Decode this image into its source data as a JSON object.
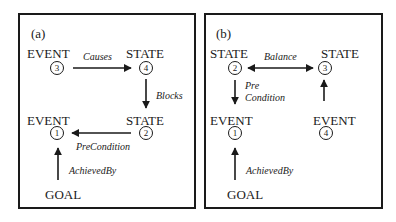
{
  "panels": [
    {
      "tag": "(a)",
      "nodes": [
        {
          "type": "EVENT",
          "number": "3"
        },
        {
          "type": "STATE",
          "number": "4"
        },
        {
          "type": "STATE",
          "number": "2"
        },
        {
          "type": "EVENT",
          "number": "1"
        },
        {
          "type": "GOAL",
          "number": ""
        }
      ],
      "edges": [
        {
          "label": "Causes",
          "from": "EVENT 3",
          "to": "STATE 4"
        },
        {
          "label": "Blocks",
          "from": "STATE 4",
          "to": "STATE 2"
        },
        {
          "label": "PreCondition",
          "from": "STATE 2",
          "to": "EVENT 1"
        },
        {
          "label": "AchievedBy",
          "from": "GOAL",
          "to": "EVENT 1"
        }
      ]
    },
    {
      "tag": "(b)",
      "nodes": [
        {
          "type": "STATE",
          "number": "2"
        },
        {
          "type": "STATE",
          "number": "3"
        },
        {
          "type": "EVENT",
          "number": "1"
        },
        {
          "type": "EVENT",
          "number": "4"
        },
        {
          "type": "GOAL",
          "number": ""
        }
      ],
      "edges": [
        {
          "label": "Balance",
          "from": "STATE 2",
          "to": "STATE 3",
          "bidirectional": true
        },
        {
          "label_line1": "Pre",
          "label_line2": "Condition",
          "from": "STATE 2",
          "to": "EVENT 1"
        },
        {
          "label": "",
          "from": "EVENT 4",
          "to": "STATE 3"
        },
        {
          "label": "AchievedBy",
          "from": "GOAL",
          "to": "EVENT 1"
        }
      ]
    }
  ]
}
